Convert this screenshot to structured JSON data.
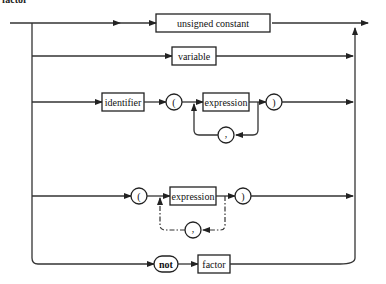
{
  "diagram": {
    "title": "factor",
    "nonterminals": {
      "unsigned_constant": "unsigned constant",
      "variable": "variable",
      "identifier": "identifier",
      "expression_1": "expression",
      "expression_2": "expression",
      "factor": "factor"
    },
    "terminals": {
      "lparen_1": "(",
      "rparen_1": ")",
      "comma_1": ",",
      "lparen_2": "(",
      "rparen_2": ")",
      "comma_2": ",",
      "not": "not"
    }
  }
}
